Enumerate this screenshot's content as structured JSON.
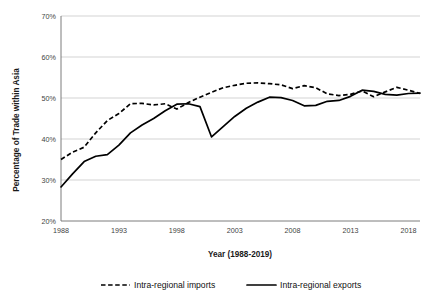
{
  "chart_data": {
    "type": "line",
    "title": "",
    "xlabel": "Year (1988-2019)",
    "ylabel": "Percentage of Trade within Asia",
    "xlim": [
      1988,
      2019
    ],
    "ylim": [
      20,
      70
    ],
    "grid": true,
    "legend_position": "bottom",
    "ytick_labels": [
      "70%",
      "60%",
      "50%",
      "40%",
      "30%",
      "20%"
    ],
    "ytick_values": [
      70,
      60,
      50,
      40,
      30,
      20
    ],
    "xtick_labels": [
      "1988",
      "1993",
      "1998",
      "2003",
      "2008",
      "2013",
      "2018"
    ],
    "xtick_values": [
      1988,
      1993,
      1998,
      2003,
      2008,
      2013,
      2018
    ],
    "x": [
      1988,
      1989,
      1990,
      1991,
      1992,
      1993,
      1994,
      1995,
      1996,
      1997,
      1998,
      1999,
      2000,
      2001,
      2002,
      2003,
      2004,
      2005,
      2006,
      2007,
      2008,
      2009,
      2010,
      2011,
      2012,
      2013,
      2014,
      2015,
      2016,
      2017,
      2018,
      2019
    ],
    "series": [
      {
        "name": "Intra-regional imports",
        "style": "dashed",
        "color": "#000000",
        "values": [
          35.0,
          36.8,
          38.0,
          41.5,
          44.5,
          46.2,
          48.6,
          48.7,
          48.3,
          48.6,
          47.3,
          48.9,
          50.2,
          51.4,
          52.5,
          53.1,
          53.6,
          53.7,
          53.5,
          53.2,
          52.3,
          53.0,
          52.5,
          51.0,
          50.6,
          50.9,
          51.7,
          50.3,
          51.5,
          52.6,
          51.9,
          51.1
        ]
      },
      {
        "name": "Intra-regional exports",
        "style": "solid",
        "color": "#000000",
        "values": [
          28.3,
          31.5,
          34.5,
          35.8,
          36.2,
          38.5,
          41.5,
          43.4,
          45.0,
          46.9,
          48.5,
          48.6,
          47.9,
          40.5,
          43.0,
          45.5,
          47.5,
          49.0,
          50.2,
          50.1,
          49.4,
          48.1,
          48.2,
          49.2,
          49.4,
          50.4,
          51.9,
          51.6,
          50.9,
          50.7,
          51.1,
          51.2
        ]
      }
    ]
  },
  "legend": {
    "items": [
      {
        "label": "Intra-regional imports",
        "marker": "dashed-line-marker"
      },
      {
        "label": "Intra-regional exports",
        "marker": "solid-line-marker"
      }
    ]
  }
}
